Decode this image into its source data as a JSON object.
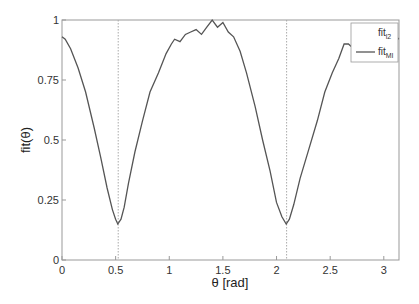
{
  "chart_data": {
    "type": "line",
    "title": "",
    "xlabel": "θ [rad]",
    "ylabel": "fit(θ)",
    "xlim": [
      0,
      3.1416
    ],
    "ylim": [
      0,
      1
    ],
    "grid": false,
    "xticks": [
      "0",
      "0.5",
      "1",
      "1.5",
      "2",
      "2.5",
      "3"
    ],
    "yticks": [
      "0",
      "0.25",
      "0.5",
      "0.75",
      "1"
    ],
    "legend": {
      "position": "upper right",
      "entries": [
        "fit_l2",
        "fit_MI"
      ]
    },
    "vlines": [
      0.524,
      2.094
    ],
    "series": [
      {
        "name": "fit_l2",
        "x": [],
        "y": []
      },
      {
        "name": "fit_MI",
        "x": [
          0,
          0.03,
          0.08,
          0.15,
          0.22,
          0.3,
          0.36,
          0.42,
          0.47,
          0.5,
          0.52,
          0.55,
          0.58,
          0.62,
          0.68,
          0.75,
          0.82,
          0.9,
          0.97,
          1.02,
          1.05,
          1.1,
          1.15,
          1.2,
          1.25,
          1.3,
          1.35,
          1.4,
          1.45,
          1.5,
          1.55,
          1.6,
          1.66,
          1.72,
          1.8,
          1.87,
          1.94,
          2.0,
          2.05,
          2.09,
          2.12,
          2.16,
          2.22,
          2.3,
          2.38,
          2.45,
          2.52,
          2.58,
          2.63,
          2.67,
          2.72,
          2.78,
          2.85,
          2.92,
          3.0,
          3.05,
          3.1,
          3.14
        ],
        "y": [
          0.93,
          0.92,
          0.88,
          0.8,
          0.7,
          0.55,
          0.43,
          0.3,
          0.21,
          0.17,
          0.15,
          0.17,
          0.22,
          0.32,
          0.45,
          0.58,
          0.7,
          0.78,
          0.86,
          0.9,
          0.92,
          0.91,
          0.94,
          0.95,
          0.96,
          0.94,
          0.97,
          1.0,
          0.97,
          0.99,
          0.95,
          0.93,
          0.87,
          0.78,
          0.64,
          0.5,
          0.37,
          0.24,
          0.18,
          0.15,
          0.17,
          0.23,
          0.34,
          0.46,
          0.58,
          0.7,
          0.78,
          0.84,
          0.9,
          0.9,
          0.88,
          0.92,
          0.93,
          0.95,
          0.93,
          0.96,
          0.94,
          0.92
        ]
      }
    ]
  },
  "labels": {
    "xlabel": "θ [rad]",
    "ylabel": "fit(θ)",
    "legend_1_main": "fit",
    "legend_1_sub": "l2",
    "legend_2_main": "fit",
    "legend_2_sub": "MI"
  }
}
